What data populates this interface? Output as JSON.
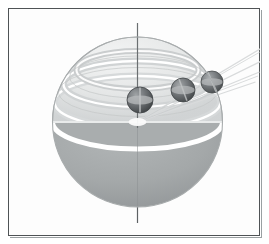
{
  "figure": {
    "title": "Sphere with polar axis, latitude rings and three marker spheres",
    "type": "technical-illustration",
    "canvas": {
      "width": 269,
      "height": 244
    },
    "background_color": "#ffffff",
    "frame": {
      "border_color": "#4f5355",
      "border_width_px": 1,
      "x": 8,
      "y": 8,
      "width": 252,
      "height": 228,
      "fill_color": "#fdfdfd"
    }
  },
  "sphere": {
    "label": "translucent sphere",
    "center_x": 129.5,
    "center_y": 114,
    "radius": 85,
    "outline_color": "#b9bcbd",
    "upper_hemisphere_color": "#e6e8e8",
    "lower_hemisphere_color": "#a3a7a8",
    "equator_band_color": "#fdfdfd",
    "equator_band_width_px": 5,
    "equator_ellipse_ry": 27
  },
  "axis": {
    "label": "polar axis",
    "color": "#5d6163",
    "width_px": 1,
    "top_y": -66,
    "bottom_y": 101,
    "top_overhang_px": 15,
    "bottom_overhang_px": 16
  },
  "latitude_rings": [
    {
      "name": "ring-upper",
      "cy": -52,
      "rx": 61,
      "ry": 19,
      "color": "#ffffff",
      "shade_color": "#c9cccd"
    },
    {
      "name": "ring-middle",
      "cy": -38,
      "rx": 74,
      "ry": 23,
      "color": "#ffffff",
      "shade_color": "#cfd2d3"
    },
    {
      "name": "ring-lower",
      "cy": -20,
      "rx": 83,
      "ry": 26,
      "color": "#ffffff",
      "shade_color": "#d4d7d8"
    }
  ],
  "rays": {
    "label": "rays from sphere center",
    "origin_x": 129.5,
    "origin_y": 114,
    "color": "#d8dadb",
    "edge_color": "#c3c6c7",
    "width_px": 1,
    "lines": [
      {
        "name": "ray-1",
        "dx": 124,
        "dy": -74
      },
      {
        "name": "ray-2",
        "dx": 126,
        "dy": -62
      },
      {
        "name": "ray-3",
        "dx": 122,
        "dy": -50
      },
      {
        "name": "ray-4",
        "dx": 118,
        "dy": -40
      }
    ]
  },
  "marker_spheres": [
    {
      "name": "marker-sphere-1",
      "cx": 132,
      "cy": 92,
      "r": 13,
      "fill": "#6b6f71",
      "highlight": "#9a9ea0",
      "shadow": "#4a4e50",
      "band_color": "#c8cbcc"
    },
    {
      "name": "marker-sphere-2",
      "cx": 175,
      "cy": 82,
      "r": 12,
      "fill": "#6f7375",
      "highlight": "#9ea2a4",
      "shadow": "#4e5254",
      "band_color": "#c8cbcc"
    },
    {
      "name": "marker-sphere-3",
      "cx": 204,
      "cy": 74,
      "r": 11,
      "fill": "#737779",
      "highlight": "#a2a6a8",
      "shadow": "#525658",
      "band_color": "#c8cbcc"
    }
  ],
  "center_marker": {
    "name": "center-glow",
    "cx": 129.5,
    "cy": 114,
    "rx": 9,
    "ry": 4,
    "color": "#fbfbfb"
  }
}
